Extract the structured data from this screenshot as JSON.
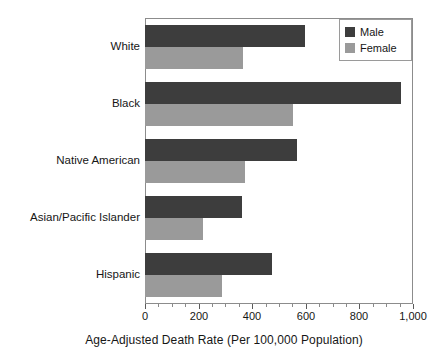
{
  "chart_data": {
    "type": "bar",
    "orientation": "horizontal",
    "title": "",
    "xlabel": "Age-Adjusted Death Rate (Per 100,000 Population)",
    "ylabel": "",
    "categories": [
      "White",
      "Black",
      "Native American",
      "Asian/Pacific Islander",
      "Hispanic"
    ],
    "series": [
      {
        "name": "Male",
        "color": "#3d3d3d",
        "values": [
          597,
          955,
          567,
          362,
          474
        ]
      },
      {
        "name": "Female",
        "color": "#9a9a9a",
        "values": [
          366,
          552,
          373,
          216,
          287
        ]
      }
    ],
    "xlim": [
      0,
      1000
    ],
    "xticks": [
      0,
      200,
      400,
      600,
      800,
      1000
    ],
    "xtick_labels": [
      "0",
      "200",
      "400",
      "600",
      "800",
      "1,000"
    ],
    "minor_tick_interval": 50,
    "grid": false,
    "legend_position": "top-right",
    "legend_entries": [
      "Male",
      "Female"
    ]
  },
  "legend": {
    "items": [
      {
        "label": "Male",
        "swatch": "male-swatch"
      },
      {
        "label": "Female",
        "swatch": "female-swatch"
      }
    ]
  },
  "axis": {
    "title": "Age-Adjusted Death Rate (Per 100,000 Population)"
  }
}
